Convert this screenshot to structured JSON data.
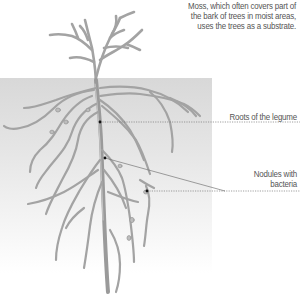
{
  "diagram": {
    "labels": {
      "moss_line1": "Moss, which often covers part of",
      "moss_line2": "the bark of trees in moist areas,",
      "moss_line3": "uses the trees as a substrate.",
      "roots": "Roots of the legume",
      "nodules_line1": "Nodules with",
      "nodules_line2": "bacteria"
    },
    "colors": {
      "plant": "#a6a6a6",
      "plant_outline": "#8c8c8c",
      "soil_top": "#d8d8d8",
      "soil_bottom": "#ffffff",
      "label_text": "#555555",
      "leader": "#777777"
    }
  }
}
